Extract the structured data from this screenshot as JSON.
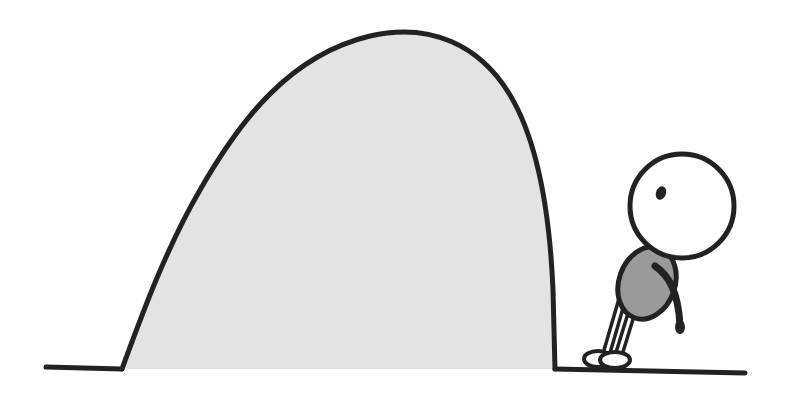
{
  "illustration": {
    "description": "Cartoon of a small stick figure leaning toward a large gray hump in the ground",
    "colors": {
      "background": "#ffffff",
      "outline": "#222222",
      "hump_fill": "#e3e3e3",
      "body_fill": "#9a9a9a",
      "head_fill": "#ffffff"
    },
    "ground": {
      "y": 369
    },
    "hump": {
      "left_x": 122,
      "right_x": 555,
      "peak_x": 370,
      "peak_y": 36
    },
    "figure": {
      "head": {
        "cx": 682,
        "cy": 206,
        "r": 52
      },
      "torso": {
        "cx": 645,
        "cy": 285
      },
      "eye": {
        "cx": 660,
        "cy": 193
      }
    }
  }
}
